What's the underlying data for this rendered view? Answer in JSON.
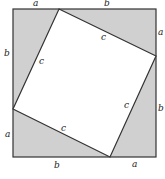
{
  "diagram": {
    "colors": {
      "background": "#ffffff",
      "shaded_triangles": "#d0d0d0",
      "inner_square": "#ffffff",
      "stroke": "#333333",
      "label": "#222222"
    },
    "outer_square": {
      "x1": 13,
      "y1": 9,
      "x2": 156,
      "y2": 157
    },
    "inner_square_points": "59,9 156,56 110,157 13,109",
    "triangles": [
      {
        "name": "top-left-triangle",
        "points": "13,9 59,9 13,109"
      },
      {
        "name": "top-right-triangle",
        "points": "59,9 156,9 156,56"
      },
      {
        "name": "bottom-right-triangle",
        "points": "156,56 156,157 110,157"
      },
      {
        "name": "bottom-left-triangle",
        "points": "13,109 110,157 13,157"
      }
    ],
    "labels": {
      "top_a": "a",
      "top_b": "b",
      "right_a": "a",
      "right_b": "b",
      "bottom_b": "b",
      "bottom_a": "a",
      "left_b": "b",
      "left_a": "a",
      "hyp_top_left": "c",
      "hyp_top_right": "c",
      "hyp_bottom_right": "c",
      "hyp_bottom_left": "c"
    }
  }
}
